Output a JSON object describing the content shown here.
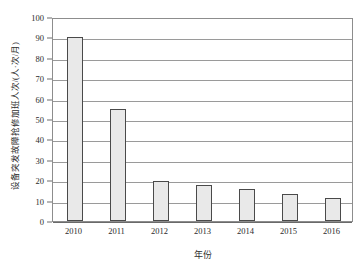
{
  "chart_data": {
    "type": "bar",
    "title": "",
    "subtitle": "",
    "xlabel": "年份",
    "ylabel": "设备突发故障抢修加班人次/(人·次/月)",
    "categories": [
      "2010",
      "2011",
      "2012",
      "2013",
      "2014",
      "2015",
      "2016"
    ],
    "values": [
      90,
      55,
      19.5,
      17.5,
      15.5,
      13,
      11.5
    ],
    "series": [
      {
        "name": "设备突发故障抢修加班人次",
        "values": [
          90,
          55,
          19.5,
          17.5,
          15.5,
          13,
          11.5
        ]
      }
    ],
    "ylim": [
      0,
      100
    ],
    "ytick_values": [
      0,
      10,
      20,
      30,
      40,
      50,
      60,
      70,
      80,
      90,
      100
    ],
    "ytick_labels": [
      "0",
      "10",
      "20",
      "30",
      "40",
      "50",
      "60",
      "70",
      "80",
      "90",
      "100"
    ],
    "grid": true,
    "grid_axis": "y",
    "legend": false,
    "legend_position": "none",
    "bar_fill_color": "#e9e9e9",
    "bar_border_color": "#4a4a4a",
    "plot_border_color": "#8d8d8d",
    "gridline_color": "#9a9a9a",
    "background_color": "#ffffff",
    "annotations": []
  }
}
